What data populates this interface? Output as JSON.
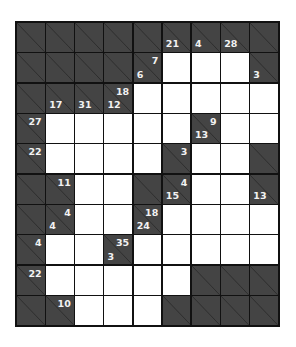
{
  "puzzle": {
    "type": "kakuro",
    "rows": 10,
    "cols": 9,
    "colors": {
      "block": "#444444",
      "line": "#111111",
      "empty": "#ffffff",
      "clue_text": "#f2f2f2"
    },
    "cells": [
      [
        {
          "t": "b"
        },
        {
          "t": "b"
        },
        {
          "t": "b"
        },
        {
          "t": "b"
        },
        {
          "t": "b"
        },
        {
          "t": "b",
          "down": "21"
        },
        {
          "t": "b",
          "down": "4"
        },
        {
          "t": "b",
          "down": "28"
        },
        {
          "t": "b"
        }
      ],
      [
        {
          "t": "b"
        },
        {
          "t": "b"
        },
        {
          "t": "b"
        },
        {
          "t": "b"
        },
        {
          "t": "b",
          "right": "7",
          "down": "6"
        },
        {
          "t": "w"
        },
        {
          "t": "w"
        },
        {
          "t": "w"
        },
        {
          "t": "b",
          "down": "3"
        }
      ],
      [
        {
          "t": "b"
        },
        {
          "t": "b",
          "down": "17"
        },
        {
          "t": "b",
          "down": "31"
        },
        {
          "t": "b",
          "right": "18",
          "down": "12"
        },
        {
          "t": "w"
        },
        {
          "t": "w"
        },
        {
          "t": "w"
        },
        {
          "t": "w"
        },
        {
          "t": "w"
        }
      ],
      [
        {
          "t": "b",
          "right": "27"
        },
        {
          "t": "w"
        },
        {
          "t": "w"
        },
        {
          "t": "w"
        },
        {
          "t": "w"
        },
        {
          "t": "w"
        },
        {
          "t": "b",
          "right": "9",
          "down": "13"
        },
        {
          "t": "w"
        },
        {
          "t": "w"
        }
      ],
      [
        {
          "t": "b",
          "right": "22"
        },
        {
          "t": "w"
        },
        {
          "t": "w"
        },
        {
          "t": "w"
        },
        {
          "t": "w"
        },
        {
          "t": "b",
          "right": "3"
        },
        {
          "t": "w"
        },
        {
          "t": "w"
        },
        {
          "t": "b"
        }
      ],
      [
        {
          "t": "b"
        },
        {
          "t": "b",
          "right": "11"
        },
        {
          "t": "w"
        },
        {
          "t": "w"
        },
        {
          "t": "b"
        },
        {
          "t": "b",
          "right": "4",
          "down": "15"
        },
        {
          "t": "w"
        },
        {
          "t": "w"
        },
        {
          "t": "b",
          "down": "13"
        }
      ],
      [
        {
          "t": "b"
        },
        {
          "t": "b",
          "right": "4",
          "down": "4"
        },
        {
          "t": "w"
        },
        {
          "t": "w"
        },
        {
          "t": "b",
          "right": "18",
          "down": "24"
        },
        {
          "t": "w"
        },
        {
          "t": "w"
        },
        {
          "t": "w"
        },
        {
          "t": "w"
        }
      ],
      [
        {
          "t": "b",
          "right": "4"
        },
        {
          "t": "w"
        },
        {
          "t": "w"
        },
        {
          "t": "b",
          "right": "35",
          "down": "3"
        },
        {
          "t": "w"
        },
        {
          "t": "w"
        },
        {
          "t": "w"
        },
        {
          "t": "w"
        },
        {
          "t": "w"
        }
      ],
      [
        {
          "t": "b",
          "right": "22"
        },
        {
          "t": "w"
        },
        {
          "t": "w"
        },
        {
          "t": "w"
        },
        {
          "t": "w"
        },
        {
          "t": "w"
        },
        {
          "t": "b"
        },
        {
          "t": "b"
        },
        {
          "t": "b"
        }
      ],
      [
        {
          "t": "b"
        },
        {
          "t": "b",
          "right": "10"
        },
        {
          "t": "w"
        },
        {
          "t": "w"
        },
        {
          "t": "w"
        },
        {
          "t": "b"
        },
        {
          "t": "b"
        },
        {
          "t": "b"
        },
        {
          "t": "b"
        }
      ]
    ]
  }
}
